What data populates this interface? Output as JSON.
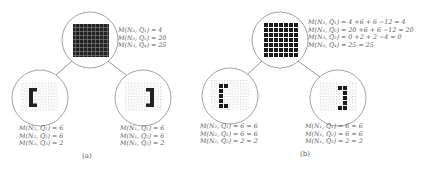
{
  "panels": [
    {
      "id": "a",
      "caption": "(a)",
      "top_node": {
        "label": "N3",
        "pattern": "full-grid-solid",
        "equations": [
          "M(N₃, Q₁) = 4",
          "M(N₃, Q₂) = 20",
          "M(N₃, Q₄) = 25"
        ]
      },
      "left_node": {
        "label": "N2",
        "pattern": "left-bracket",
        "equations": [
          "M(N₂, Q₁) = 6",
          "M(N₂, Q₂) = 6",
          "M(N₂, Q₃) = 2"
        ]
      },
      "right_node": {
        "label": "N1",
        "pattern": "right-bracket",
        "equations": [
          "M(N₁, Q₁) = 6",
          "M(N₁, Q₂) = 6",
          "M(N₁, Q₃) = 2"
        ]
      }
    },
    {
      "id": "b",
      "caption": "(b)",
      "top_node": {
        "label": "N3",
        "pattern": "full-grid-blocks",
        "equations": [
          "M(N₃, Q₁) = 4 +6 + 6 −12 = 4",
          "M(N₃, Q₂) = 20 +6 + 6 −12 = 20",
          "M(N₃, Q₃) = 0 +2 + 2 −4 = 0",
          "M(N₃, Q₄) = 25 = 25"
        ]
      },
      "left_node": {
        "label": "N2",
        "pattern": "left-bracket-blocks",
        "equations": [
          "M(N₂, Q₁) = 6 = 6",
          "M(N₂, Q₂) = 6 = 6",
          "M(N₂, Q₃) = 2 = 2"
        ]
      },
      "right_node": {
        "label": "N1",
        "pattern": "right-bracket-blocks",
        "equations": [
          "M(N₁, Q₁) = 6 = 6",
          "M(N₁, Q₂) = 6 = 6",
          "M(N₁, Q₃) = 2 = 2"
        ]
      }
    }
  ],
  "colors": {
    "circle": "#8a8a8a",
    "cell_dark": "#1a1a1a",
    "grid_dot": "#b8b8b8",
    "text": "#5a5a5a"
  }
}
